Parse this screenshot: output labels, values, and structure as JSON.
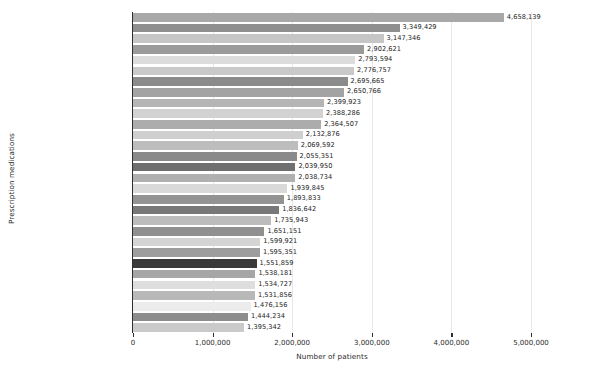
{
  "chart_data": {
    "type": "bar",
    "orientation": "horizontal",
    "title": "",
    "xlabel": "Number of patients",
    "ylabel": "Prescription medications",
    "xlim": [
      0,
      5000000
    ],
    "xticks": [
      0,
      1000000,
      2000000,
      3000000,
      4000000,
      5000000
    ],
    "xtick_labels": [
      "0",
      "1,000,000",
      "2,000,000",
      "3,000,000",
      "4,000,000",
      "5,000,000"
    ],
    "grid": "vertical",
    "legend": "none",
    "categories": [
      "Atorvastatin calcium",
      "Amlodipine besylate",
      "Aspirin",
      "Lisinopril",
      "Albuterol sulfate",
      "Hydrocodone/acetaminophen",
      "Prednisone",
      "Acetaminophen",
      "Furosemide",
      "Levothyroxine sodium",
      "Metoprolol succinate",
      "Gabapentin",
      "Losartan potassium",
      "Omeprazole",
      "Pantoprazole sodium",
      "Metformin HCl",
      "Fluticasone propionate",
      "Tramadol HCl",
      "Cephalexin",
      "Metoprolol tartrate",
      "Oxycodone HCl",
      "Azithromycin",
      "Tamsulosin HCl",
      "Hydrochlorothiazide",
      "Amoxicillin/potassium clav",
      "Apixaban",
      "Polyethylene glycol 3350",
      "Potassium chloride",
      "Rosuvastatin calcium",
      "Diclofenac sodium"
    ],
    "values": [
      4658139,
      3349429,
      3147346,
      2902621,
      2793594,
      2776757,
      2695665,
      2650766,
      2399923,
      2388286,
      2364507,
      2132876,
      2069592,
      2055351,
      2039950,
      2038734,
      1939845,
      1893833,
      1836642,
      1735943,
      1651151,
      1599921,
      1595351,
      1551859,
      1538181,
      1534727,
      1531856,
      1476156,
      1444234,
      1395342
    ],
    "value_labels": [
      "4,658,139",
      "3,349,429",
      "3,147,346",
      "2,902,621",
      "2,793,594",
      "2,776,757",
      "2,695,665",
      "2,650,766",
      "2,399,923",
      "2,388,286",
      "2,364,507",
      "2,132,876",
      "2,069,592",
      "2,055,351",
      "2,039,950",
      "2,038,734",
      "1,939,845",
      "1,893,833",
      "1,836,642",
      "1,735,943",
      "1,651,151",
      "1,599,921",
      "1,595,351",
      "1,551,859",
      "1,538,181",
      "1,534,727",
      "1,531,856",
      "1,476,156",
      "1,444,234",
      "1,395,342"
    ],
    "bar_colors": [
      "#a8a8a8",
      "#8f8f8f",
      "#c6c6c6",
      "#9a9a9a",
      "#dcdcdc",
      "#c9c9c9",
      "#8b8b8b",
      "#a3a3a3",
      "#b5b5b5",
      "#d2d2d2",
      "#acacac",
      "#cfcfcf",
      "#bdbdbd",
      "#8a8a8a",
      "#6f6f6f",
      "#b0b0b0",
      "#d9d9d9",
      "#939393",
      "#787878",
      "#bcbcbc",
      "#909090",
      "#d4d4d4",
      "#9d9d9d",
      "#3a3a3a",
      "#a6a6a6",
      "#dedede",
      "#b8b8b8",
      "#ececec",
      "#8d8d8d",
      "#cacaca"
    ],
    "grid_color": "#e8e8e8",
    "axis_color": "#2f2f2f",
    "text_color": "#2b2b2b"
  }
}
